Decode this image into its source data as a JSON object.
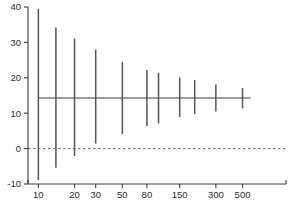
{
  "chart_data": {
    "type": "line",
    "title": "",
    "subtitle": "",
    "xlabel": "",
    "ylabel": "",
    "xscale": "log",
    "grid": false,
    "legend": "none",
    "ylim": [
      -10,
      40
    ],
    "ytick_labels": [
      "40",
      "30",
      "20",
      "10",
      "0",
      "-10"
    ],
    "ytick_values": [
      40,
      30,
      20,
      10,
      0,
      -10
    ],
    "xtick_labels": [
      "10",
      "20",
      "30",
      "50",
      "80",
      "150",
      "300",
      "500"
    ],
    "xtick_values": [
      10,
      20,
      30,
      50,
      80,
      150,
      300,
      500
    ],
    "mean_line": 14.3,
    "zero_line": 0,
    "annotations": [
      "horizontal solid line at mean 14.3",
      "dashed reference line at 0"
    ],
    "series": [
      {
        "name": "confidence interval",
        "x": [
          10,
          14,
          20,
          30,
          50,
          80,
          100,
          150,
          200,
          300,
          500
        ],
        "lower": [
          -8.9,
          -5.4,
          -2.1,
          1.4,
          4.1,
          6.4,
          7.1,
          8.9,
          9.7,
          10.5,
          11.4
        ],
        "upper": [
          39.5,
          34.2,
          31.1,
          28.0,
          24.5,
          22.2,
          21.4,
          20.1,
          19.4,
          18.1,
          17.1
        ],
        "center": [
          14.3,
          14.3,
          14.3,
          14.3,
          14.3,
          14.3,
          14.3,
          14.3,
          14.3,
          14.3,
          14.3
        ]
      }
    ]
  }
}
